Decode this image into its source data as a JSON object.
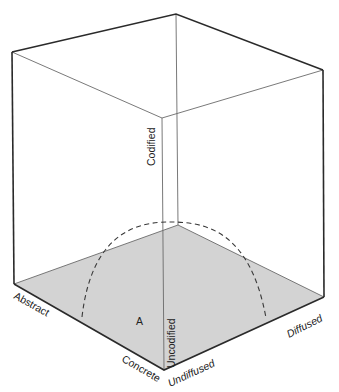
{
  "diagram": {
    "type": "3d-cube",
    "colors": {
      "background": "#ffffff",
      "floor_fill": "#d3d3d3",
      "edge_outer": "#2a2a2a",
      "edge_inner": "#6a6a6a",
      "arc": "#3a3a3a",
      "text": "#222222"
    },
    "axes": {
      "codification": {
        "high_label": "Codified",
        "low_label": "Uncodified"
      },
      "abstraction": {
        "high_label": "Abstract",
        "low_label": "Concrete"
      },
      "diffusion": {
        "low_label": "Undiffused",
        "high_label": "Diffused"
      }
    },
    "region_label": "A",
    "curve": {
      "style": "dashed",
      "description": "arc on the base plane"
    }
  }
}
